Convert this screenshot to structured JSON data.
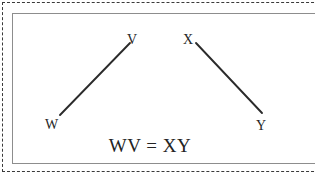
{
  "figure": {
    "equation": "WV = XY",
    "stroke_color": "#2b2b2b",
    "panel_border_color": "#8d8d8d",
    "dashed_border_color": "#3a3a3a",
    "background_color": "#ffffff",
    "labels": {
      "w": "W",
      "v": "V",
      "x": "X",
      "y": "Y"
    },
    "segments": [
      {
        "name": "WV",
        "from_label": "W",
        "to_label": "V",
        "x1": 60,
        "y1": 115,
        "x2": 130,
        "y2": 43
      },
      {
        "name": "XY",
        "from_label": "X",
        "to_label": "Y",
        "x1": 196,
        "y1": 43,
        "x2": 262,
        "y2": 113
      }
    ]
  }
}
